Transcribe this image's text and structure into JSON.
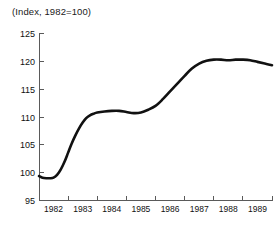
{
  "chart_data": {
    "type": "line",
    "title": "(Index, 1982=100)",
    "xlabel": "",
    "ylabel": "",
    "grid": false,
    "legend": null,
    "ylim": [
      95,
      125
    ],
    "yticks": [
      95,
      100,
      105,
      110,
      115,
      120,
      125
    ],
    "ytick_labels": [
      "95",
      "100",
      "105",
      "110",
      "115",
      "120",
      "125"
    ],
    "xlim": [
      1982.0,
      1990.0
    ],
    "xticks": [
      1982,
      1983,
      1984,
      1985,
      1986,
      1987,
      1988,
      1989,
      1990
    ],
    "categories": [
      "1982",
      "1983",
      "1984",
      "1985",
      "1986",
      "1987",
      "1988",
      "1989"
    ],
    "xtick_labels": [
      "1982",
      "1983",
      "1984",
      "1985",
      "1986",
      "1987",
      "1988",
      "1989"
    ],
    "xtick_label_position": "between-ticks",
    "line_color": "#111111",
    "axis_color": "#5a5a5a",
    "background_color": "#ffffff",
    "series": [
      {
        "name": "Index, 1982=100",
        "x": [
          1982.0,
          1982.12,
          1982.25,
          1982.38,
          1982.5,
          1982.62,
          1982.75,
          1982.88,
          1983.0,
          1983.12,
          1983.25,
          1983.38,
          1983.5,
          1983.62,
          1983.75,
          1983.88,
          1984.0,
          1984.25,
          1984.5,
          1984.75,
          1985.0,
          1985.25,
          1985.5,
          1985.75,
          1986.0,
          1986.25,
          1986.5,
          1986.75,
          1987.0,
          1987.25,
          1987.5,
          1987.75,
          1988.0,
          1988.25,
          1988.5,
          1988.75,
          1989.0,
          1989.25,
          1989.5,
          1989.75,
          1990.0
        ],
        "values": [
          99.4,
          99.1,
          99.0,
          99.0,
          99.1,
          99.6,
          100.6,
          102.0,
          103.6,
          105.2,
          106.7,
          108.0,
          109.0,
          109.8,
          110.3,
          110.6,
          110.8,
          111.0,
          111.1,
          111.1,
          110.9,
          110.7,
          110.8,
          111.3,
          112.0,
          113.2,
          114.6,
          116.0,
          117.4,
          118.7,
          119.6,
          120.1,
          120.3,
          120.3,
          120.2,
          120.3,
          120.3,
          120.2,
          119.9,
          119.6,
          119.3
        ]
      }
    ],
    "annotations": []
  }
}
